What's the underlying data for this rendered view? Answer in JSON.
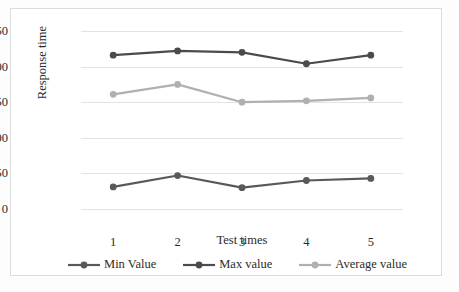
{
  "chart_data": {
    "type": "line",
    "title": "",
    "xlabel": "Test times",
    "ylabel": "Response time",
    "categories": [
      "1",
      "2",
      "3",
      "4",
      "5"
    ],
    "x": [
      1,
      2,
      3,
      4,
      5
    ],
    "series": [
      {
        "name": "Min Value",
        "values": [
          31,
          47,
          30,
          40,
          43
        ],
        "color": "#595959"
      },
      {
        "name": "Max value",
        "values": [
          216,
          222,
          220,
          204,
          216
        ],
        "color": "#4b4b4b"
      },
      {
        "name": "Average value",
        "values": [
          161,
          175,
          150,
          152,
          156
        ],
        "color": "#b0b0b0"
      }
    ],
    "ylim": [
      0,
      250
    ],
    "yticks": [
      0,
      50,
      100,
      150,
      200,
      250
    ],
    "ytick_labels": [
      "0",
      "50",
      "100",
      "150",
      "200",
      "250"
    ],
    "grid": "horizontal",
    "legend_position": "bottom",
    "frame_color": "#dcdcdc",
    "gridline_color": "#e3e3e3",
    "background": "#ffffff"
  }
}
